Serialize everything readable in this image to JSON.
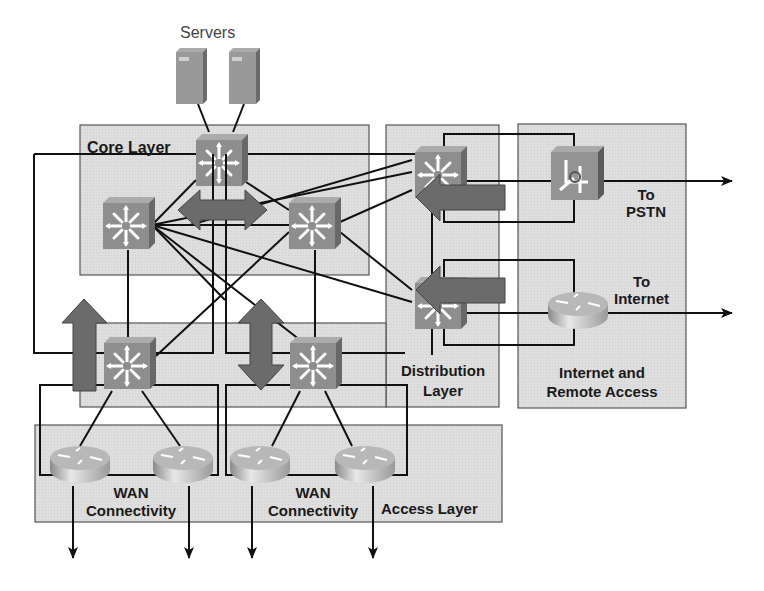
{
  "title": "Servers",
  "layers": {
    "core": {
      "label": "Core Layer"
    },
    "distribution": {
      "label_line1": "Distribution",
      "label_line2": "Layer"
    },
    "access": {
      "label": "Access Layer"
    },
    "internet": {
      "label_line1": "Internet and",
      "label_line2": "Remote Access"
    }
  },
  "wan_groups": [
    {
      "label_line1": "WAN",
      "label_line2": "Connectivity"
    },
    {
      "label_line1": "WAN",
      "label_line2": "Connectivity"
    }
  ],
  "destinations": {
    "pstn": {
      "line1": "To",
      "line2": "PSTN"
    },
    "internet": {
      "line1": "To",
      "line2": "Internet"
    }
  },
  "devices": {
    "servers": [
      "server-1",
      "server-2"
    ],
    "core_switches": [
      "core-switch-top",
      "core-switch-left",
      "core-switch-right"
    ],
    "distribution_switches": [
      "dist-switch-left",
      "dist-switch-middle",
      "dist-switch-pstn",
      "dist-switch-internet"
    ],
    "voice_switch": "pstn-voice-switch",
    "internet_router": "internet-router",
    "wan_routers": [
      "wan-router-1",
      "wan-router-2",
      "wan-router-3",
      "wan-router-4"
    ]
  },
  "colors": {
    "box_fill": "#dcdcdc",
    "box_stroke": "#555555",
    "switch_front": "#8c8c8c",
    "switch_top": "#a8a8a8",
    "switch_side": "#6a6a6a",
    "arrow_fill": "#6e6e6e",
    "line": "#111111"
  }
}
